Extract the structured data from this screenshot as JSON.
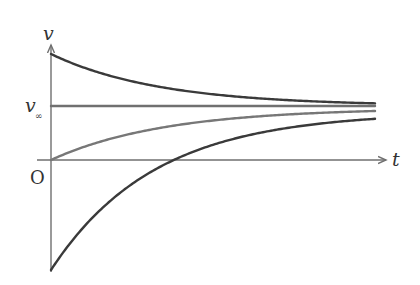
{
  "diagram": {
    "axes": {
      "origin_label": "O",
      "x_label": "t",
      "y_label": "v",
      "terminal_label_main": "v",
      "terminal_label_sub": "∞",
      "origin_px": [
        51,
        160
      ],
      "x_axis_end_px": 386,
      "y_axis_top_px": 45,
      "y_axis_bottom_px": 272,
      "color": "#6f6f6f"
    },
    "curves": [
      {
        "name": "start-above-terminal",
        "x0": 51,
        "x1": 375,
        "y_start": 54,
        "y_inf": 106,
        "k": 0.0092,
        "color": "#3a3a3a",
        "width": 2.4
      },
      {
        "name": "at-terminal",
        "x0": 51,
        "x1": 375,
        "y_start": 106,
        "y_inf": 106,
        "k": 0.0,
        "color": "#707070",
        "width": 2.4
      },
      {
        "name": "start-at-rest",
        "x0": 51,
        "x1": 375,
        "y_start": 160,
        "y_inf": 108,
        "k": 0.0088,
        "color": "#777777",
        "width": 2.4
      },
      {
        "name": "start-below-zero",
        "x0": 51,
        "x1": 375,
        "y_start": 270,
        "y_inf": 112,
        "k": 0.0097,
        "color": "#3a3a3a",
        "width": 2.4
      }
    ]
  }
}
